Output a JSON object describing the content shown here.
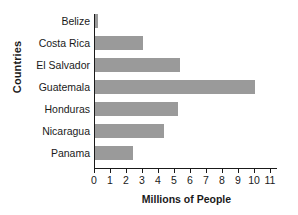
{
  "chart_data": {
    "type": "bar",
    "orientation": "horizontal",
    "title": "",
    "xlabel": "Millions of People",
    "ylabel": "Countries",
    "categories": [
      "Belize",
      "Costa Rica",
      "El Salvador",
      "Guatemala",
      "Honduras",
      "Nicaragua",
      "Panama"
    ],
    "values": [
      0.2,
      3.0,
      5.3,
      10.0,
      5.2,
      4.3,
      2.4
    ],
    "xlim": [
      0,
      11
    ],
    "xticks": [
      0,
      1,
      2,
      3,
      4,
      5,
      6,
      7,
      8,
      9,
      10,
      11
    ],
    "xtick_labels": [
      "0",
      "1",
      "2",
      "3",
      "4",
      "5",
      "6",
      "7",
      "8",
      "9",
      "10",
      "11"
    ],
    "grid": false,
    "legend": null,
    "bar_color": "#9a9a9a",
    "axis_color": "#1a1a1a",
    "background": "#ffffff"
  }
}
